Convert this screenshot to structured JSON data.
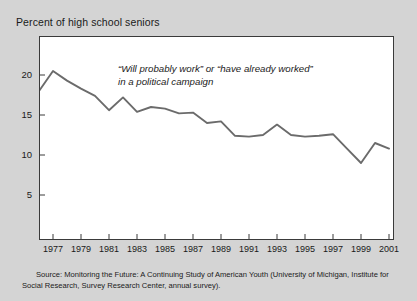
{
  "chart_title": "Percent of high school seniors",
  "annotation": {
    "line1": "“Will probably work” or “have already worked”",
    "line2": "in a political campaign"
  },
  "source": "Source: Monitoring the Future: A Continuing Study of American Youth (University of Michigan, Institute for Social Research, Survey Research Center, annual survey).",
  "colors": {
    "page_background": "#d4d4d4",
    "plot_background": "#ffffff",
    "frame": "#3a3a3a",
    "line": "#6b6b6b",
    "text": "#1a1a1a"
  },
  "chart_data": {
    "type": "line",
    "title": "Percent of high school seniors",
    "xlabel": "",
    "ylabel": "Percent of high school seniors",
    "xlim": [
      1976,
      2001
    ],
    "ylim": [
      0,
      22.5
    ],
    "grid": false,
    "legend": "none",
    "y_ticks": [
      5,
      10,
      15,
      20
    ],
    "y_tick_labels": [
      "5",
      "10",
      "15",
      "20"
    ],
    "x_ticks": [
      1977,
      1979,
      1981,
      1983,
      1985,
      1987,
      1989,
      1991,
      1993,
      1995,
      1997,
      1999,
      2001
    ],
    "x_tick_labels": [
      "1977",
      "1979",
      "1981",
      "1983",
      "1985",
      "1987",
      "1989",
      "1991",
      "1993",
      "1995",
      "1997",
      "1999",
      "2001"
    ],
    "x": [
      1976,
      1977,
      1978,
      1979,
      1980,
      1981,
      1982,
      1983,
      1984,
      1985,
      1986,
      1987,
      1988,
      1989,
      1990,
      1991,
      1992,
      1993,
      1994,
      1995,
      1996,
      1997,
      1998,
      1999,
      2000,
      2001
    ],
    "series": [
      {
        "name": "Will probably work or have already worked in a political campaign",
        "values": [
          18.0,
          20.5,
          19.3,
          18.3,
          17.4,
          15.6,
          17.2,
          15.4,
          16.0,
          15.8,
          15.2,
          15.3,
          14.0,
          14.2,
          12.4,
          12.3,
          12.5,
          13.8,
          12.5,
          12.3,
          12.4,
          12.6,
          10.8,
          9.0,
          11.5,
          10.8
        ]
      }
    ],
    "annotations": [
      {
        "text": "“Will probably work” or “have already worked” in a political campaign",
        "x": 1984,
        "y": 19.0
      }
    ]
  }
}
